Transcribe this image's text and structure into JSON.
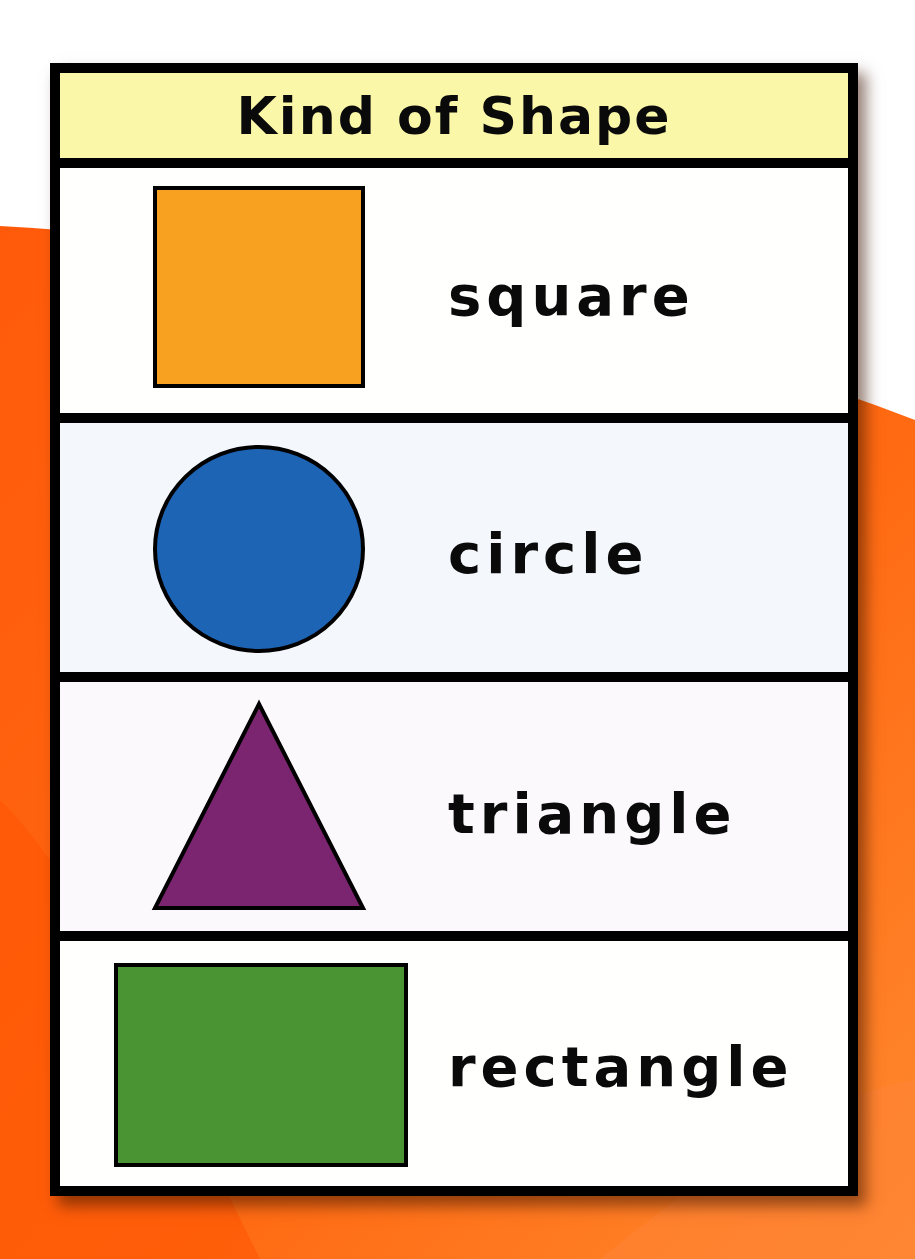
{
  "background": {
    "page_color": "#ffffff",
    "accent_color": "#ff6a12"
  },
  "chart": {
    "title": "Kind of Shape",
    "header_color": "#fbf7a8",
    "border_color": "#000000",
    "rows": [
      {
        "shape": "square",
        "label": "square",
        "fill": "#f8a020",
        "row_bg": "#fffffe"
      },
      {
        "shape": "circle",
        "label": "circle",
        "fill": "#1e64b4",
        "row_bg": "#f4f8fc"
      },
      {
        "shape": "triangle",
        "label": "triangle",
        "fill": "#7b2470",
        "row_bg": "#fbf9fc"
      },
      {
        "shape": "rectangle",
        "label": "rectangle",
        "fill": "#4a9434",
        "row_bg": "#fffffe"
      }
    ]
  }
}
